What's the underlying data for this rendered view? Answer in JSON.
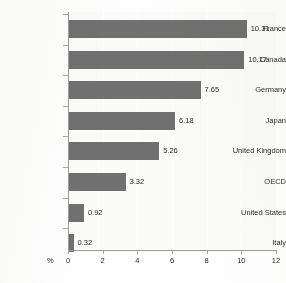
{
  "chart_data": {
    "type": "bar",
    "orientation": "horizontal",
    "title": "",
    "xlabel": "%",
    "ylabel": "",
    "xlim": [
      0,
      12
    ],
    "xticks": [
      "0",
      "2",
      "4",
      "6",
      "8",
      "10",
      "12"
    ],
    "grid": true,
    "legend": null,
    "bar_color": "#707070",
    "plot_background": "#fbfbfa",
    "categories": [
      "France",
      "Canada",
      "Germany",
      "Japan",
      "United Kingdom",
      "OECD",
      "United States",
      "Italy"
    ],
    "values": [
      10.31,
      10.17,
      7.65,
      6.18,
      5.26,
      3.32,
      0.92,
      0.32
    ],
    "value_labels": [
      "10.31",
      "10.17",
      "7.65",
      "6.18",
      "5.26",
      "3.32",
      "0.92",
      "0.32"
    ]
  }
}
